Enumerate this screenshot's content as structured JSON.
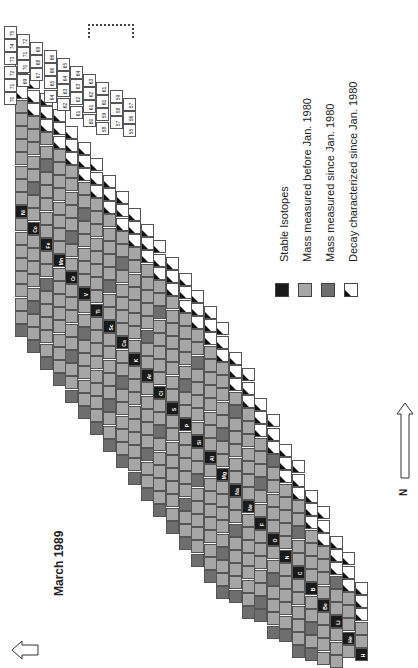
{
  "title": "March 1989",
  "legend": [
    {
      "label": "Stable Isotopes",
      "type": "stable",
      "color": "#1a1a1a"
    },
    {
      "label": "Mass measured before Jan. 1980",
      "type": "before",
      "color": "#a6a6a6"
    },
    {
      "label": "Mass measured since Jan. 1980",
      "type": "since",
      "color": "#6e6e6e"
    },
    {
      "label": "Decay characterized since Jan. 1980",
      "type": "decay",
      "color": "#ffffff"
    }
  ],
  "axes": {
    "n_label": "N",
    "z_label": "Z"
  },
  "elements": [
    "H",
    "He",
    "Li",
    "Be",
    "B",
    "C",
    "N",
    "O",
    "F",
    "Ne",
    "Na",
    "Mg",
    "Al",
    "Si",
    "P",
    "S",
    "Cl",
    "Ar",
    "K",
    "Ca",
    "Sc",
    "Ti",
    "V",
    "Cr",
    "Mn",
    "Fe",
    "Co",
    "Ni"
  ],
  "top_mass_numbers": [
    [
      "75",
      "74",
      "73",
      "72",
      "71",
      "70"
    ],
    [
      "72",
      "71",
      "70",
      "69"
    ],
    [
      "69",
      "68",
      "67"
    ],
    [
      "66",
      "66",
      "65",
      "64"
    ],
    [
      "65",
      "64",
      "63",
      "62"
    ],
    [
      "64",
      "63",
      "62",
      "61"
    ],
    [
      "63",
      "62",
      "61",
      "60"
    ],
    [
      "61",
      "60",
      "59",
      "58"
    ],
    [
      "59",
      "58",
      "57"
    ],
    [
      "57",
      "56",
      "55"
    ]
  ],
  "labeled_edge_cells": [
    "54",
    "53",
    "52",
    "51",
    "50",
    "49",
    "48",
    "47",
    "46",
    "45",
    "44",
    "43",
    "41",
    "40",
    "39",
    "38",
    "36",
    "35",
    "32",
    "31",
    "30",
    "29",
    "28",
    "27",
    "26",
    "23",
    "22",
    "19",
    "20"
  ],
  "caption_partial": "Figure 1989: ... determined before 1980 ..."
}
